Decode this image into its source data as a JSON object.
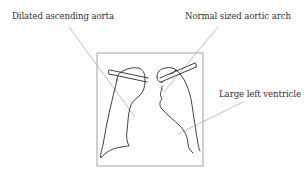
{
  "diagram": {
    "type": "chest-xray-schematic",
    "labels": {
      "ascending_aorta": "Dilated ascending aorta",
      "aortic_arch": "Normal sized aortic arch",
      "left_ventricle": "Large left ventricle"
    },
    "colors": {
      "outline": "#2a2a2a",
      "frame": "#8a8a8a",
      "leader_line": "#a8a8a8",
      "text": "#333333",
      "background": "#ffffff"
    }
  }
}
